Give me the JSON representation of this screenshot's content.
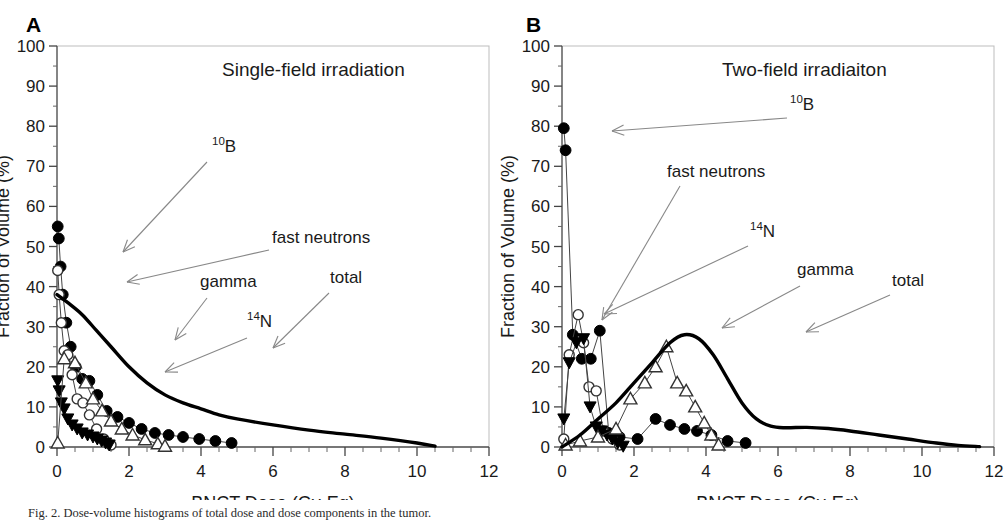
{
  "figure": {
    "caption": "Fig. 2. Dose-volume histograms of total dose and dose components in the tumor."
  },
  "panels": [
    {
      "letter": "A",
      "title": "Single-field irradiation",
      "axes": {
        "xlabel": "BNCT Dose (Gy-Eq)",
        "ylabel": "Fraction of Volume (%)",
        "xlim": [
          0,
          12
        ],
        "ylim": [
          0,
          100
        ],
        "xticks": [
          0,
          2,
          4,
          6,
          8,
          10,
          12
        ],
        "yticks": [
          0,
          10,
          20,
          30,
          40,
          50,
          60,
          70,
          80,
          90,
          100
        ],
        "xminor_step": 0.5,
        "yminor_step": 5
      },
      "annotations": [
        {
          "name": "b10",
          "text_main": "B",
          "text_sup": "10",
          "x": 155,
          "y": 152
        },
        {
          "name": "fast-neutrons",
          "text_main": "fast neutrons",
          "text_sup": "",
          "x": 215,
          "y": 243
        },
        {
          "name": "gamma",
          "text_main": "gamma",
          "text_sup": "",
          "x": 143,
          "y": 287
        },
        {
          "name": "n14",
          "text_main": "N",
          "text_sup": "14",
          "x": 190,
          "y": 327
        },
        {
          "name": "total",
          "text_main": "total",
          "text_sup": "",
          "x": 273,
          "y": 283
        }
      ]
    },
    {
      "letter": "B",
      "title": "Two-field irradiaiton",
      "axes": {
        "xlabel": "BNCT Dose (Gy-Eq)",
        "ylabel": "Fraction of Volume (%)",
        "xlim": [
          0,
          12
        ],
        "ylim": [
          0,
          100
        ],
        "xticks": [
          0,
          2,
          4,
          6,
          8,
          10,
          12
        ],
        "yticks": [
          0,
          10,
          20,
          30,
          40,
          50,
          60,
          70,
          80,
          90,
          100
        ],
        "xminor_step": 0.5,
        "yminor_step": 5
      },
      "annotations": [
        {
          "name": "b10",
          "text_main": "B",
          "text_sup": "10",
          "x": 228,
          "y": 110
        },
        {
          "name": "fast-neutrons",
          "text_main": "fast neutrons",
          "text_sup": "",
          "x": 105,
          "y": 177
        },
        {
          "name": "n14",
          "text_main": "N",
          "text_sup": "14",
          "x": 188,
          "y": 237
        },
        {
          "name": "gamma",
          "text_main": "gamma",
          "text_sup": "",
          "x": 235,
          "y": 275
        },
        {
          "name": "total",
          "text_main": "total",
          "text_sup": "",
          "x": 330,
          "y": 286
        }
      ]
    }
  ],
  "chart_data": [
    {
      "type": "line",
      "panel": "A",
      "title": "Single-field irradiation",
      "xlabel": "BNCT Dose (Gy-Eq)",
      "ylabel": "Fraction of Volume (%)",
      "xlim": [
        0,
        12
      ],
      "ylim": [
        0,
        100
      ],
      "grid": false,
      "legend": "inline-annotations",
      "series": [
        {
          "name": "10B",
          "marker": "filled-circle",
          "x": [
            0.02,
            0.05,
            0.1,
            0.16,
            0.26,
            0.38,
            0.52,
            0.7,
            0.9,
            1.12,
            1.38,
            1.68,
            2.0,
            2.35,
            2.72,
            3.1,
            3.5,
            3.95,
            4.4,
            4.85
          ],
          "y": [
            55,
            52,
            45,
            38,
            31,
            25,
            20,
            17,
            16.5,
            13,
            9,
            7.5,
            6,
            4.5,
            3.5,
            3,
            2.5,
            2,
            1.5,
            1
          ]
        },
        {
          "name": "fast neutrons",
          "marker": "open-circle",
          "x": [
            0.02,
            0.06,
            0.12,
            0.2,
            0.3,
            0.42,
            0.56,
            0.72,
            0.9,
            1.1,
            1.3,
            1.5
          ],
          "y": [
            44,
            38,
            31,
            24,
            23,
            18,
            12,
            11,
            8,
            4.5,
            2,
            0.5
          ]
        },
        {
          "name": "14N",
          "marker": "filled-triangle-down",
          "x": [
            0.02,
            0.06,
            0.12,
            0.2,
            0.3,
            0.42,
            0.56,
            0.7,
            0.85,
            1.0,
            1.12,
            1.24,
            1.35,
            1.45
          ],
          "y": [
            16.5,
            14,
            11,
            9.5,
            7,
            5.5,
            4.5,
            3.5,
            3,
            2.5,
            2,
            1.5,
            1,
            0.5
          ]
        },
        {
          "name": "gamma",
          "marker": "open-triangle-up",
          "x": [
            0.02,
            0.2,
            0.5,
            0.8,
            1.0,
            1.25,
            1.5,
            1.8,
            2.1,
            2.45,
            2.8,
            3.0
          ],
          "y": [
            1,
            22,
            21,
            16,
            12,
            9,
            6.5,
            4.5,
            3,
            1.8,
            0.8,
            0.2
          ]
        },
        {
          "name": "total",
          "marker": "none",
          "line": "thick-solid",
          "x": [
            0.0,
            0.3,
            0.7,
            1.1,
            1.5,
            2.0,
            2.5,
            3.0,
            3.5,
            4.0,
            4.5,
            5.0,
            6.0,
            7.0,
            8.0,
            9.0,
            10.0,
            10.5
          ],
          "y": [
            38,
            36,
            33,
            29,
            25,
            20,
            16,
            13,
            11,
            9.5,
            8,
            7,
            5.5,
            4.2,
            3.2,
            2.2,
            1.0,
            0.2
          ]
        }
      ]
    },
    {
      "type": "line",
      "panel": "B",
      "title": "Two-field irradiaiton",
      "xlabel": "BNCT Dose (Gy-Eq)",
      "ylabel": "Fraction of Volume (%)",
      "xlim": [
        0,
        12
      ],
      "ylim": [
        0,
        100
      ],
      "grid": false,
      "legend": "inline-annotations",
      "series": [
        {
          "name": "10B",
          "marker": "filled-circle",
          "x": [
            0.05,
            0.1,
            0.3,
            0.55,
            0.8,
            1.05,
            1.3,
            1.6,
            2.1,
            2.6,
            3.0,
            3.4,
            3.75,
            4.15,
            4.6,
            5.1
          ],
          "y": [
            79.5,
            74,
            28,
            22,
            22,
            29,
            3.5,
            2.5,
            2.0,
            7,
            5.5,
            4.5,
            4.0,
            3.0,
            1.5,
            1.0
          ]
        },
        {
          "name": "fast neutrons",
          "marker": "open-circle",
          "x": [
            0.05,
            0.2,
            0.45,
            0.6,
            0.75,
            0.95,
            1.15,
            1.4,
            1.6
          ],
          "y": [
            2,
            23,
            33,
            26,
            15,
            14,
            4,
            2,
            0.5
          ]
        },
        {
          "name": "14N",
          "marker": "filled-triangle-down",
          "x": [
            0.05,
            0.2,
            0.4,
            0.6,
            0.78,
            0.95,
            1.1,
            1.25,
            1.4,
            1.55,
            1.7
          ],
          "y": [
            7,
            21,
            26,
            27,
            10,
            5,
            4,
            3,
            2,
            1,
            0.2
          ]
        },
        {
          "name": "gamma",
          "marker": "open-triangle-up",
          "x": [
            0.1,
            0.5,
            1.0,
            1.5,
            1.9,
            2.3,
            2.6,
            2.9,
            3.2,
            3.45,
            3.7,
            3.95,
            4.15,
            4.35
          ],
          "y": [
            0.5,
            1.5,
            2.5,
            4.5,
            12,
            16,
            20,
            25,
            16,
            14,
            10,
            6,
            3,
            0.5
          ]
        },
        {
          "name": "total",
          "marker": "none",
          "line": "thick-solid",
          "x": [
            0.0,
            0.5,
            1.0,
            1.5,
            2.0,
            2.5,
            3.0,
            3.4,
            3.8,
            4.2,
            4.6,
            5.0,
            5.4,
            5.8,
            6.2,
            6.8,
            7.4,
            8.0,
            8.8,
            9.6,
            10.4,
            11.0,
            11.6
          ],
          "y": [
            0,
            3,
            7,
            11,
            16,
            21,
            26,
            28,
            27,
            23,
            17,
            11,
            7,
            5.2,
            4.8,
            4.9,
            4.6,
            4.0,
            3.0,
            2.0,
            1.0,
            0.4,
            0.1
          ]
        }
      ]
    }
  ]
}
